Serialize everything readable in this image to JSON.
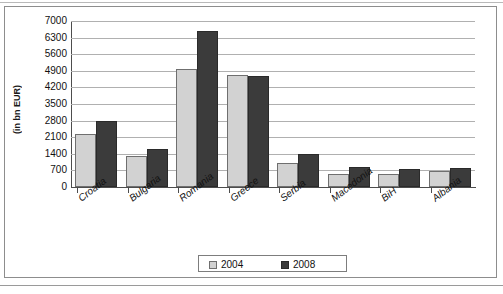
{
  "chart_data": {
    "type": "bar",
    "title": "",
    "subtitle": "",
    "xlabel": "",
    "ylabel": "(in bn EUR)",
    "ylim": [
      0,
      7000
    ],
    "ytick_step": 700,
    "yticks": [
      7000,
      6300,
      5600,
      4900,
      4200,
      3500,
      2800,
      2100,
      1400,
      700,
      0
    ],
    "grid": true,
    "legend_position": "bottom-center",
    "categories": [
      "Croatia",
      "Bulgaria",
      "Romania",
      "Greece",
      "Serbia",
      "Macedonia",
      "BiH",
      "Albania"
    ],
    "series": [
      {
        "name": "2004",
        "color": "#d2d2d2",
        "values": [
          2250,
          1320,
          4980,
          4740,
          1010,
          560,
          550,
          660
        ]
      },
      {
        "name": "2008",
        "color": "#3b3b3b",
        "values": [
          2800,
          1600,
          6600,
          4680,
          1400,
          840,
          780,
          820
        ]
      }
    ]
  },
  "legend": {
    "items": [
      {
        "label": "2004",
        "swatch": "legend-swatch-2004"
      },
      {
        "label": "2008",
        "swatch": "legend-swatch-2008"
      }
    ]
  },
  "colors": {
    "series_2004": "#d2d2d2",
    "series_2008": "#3b3b3b",
    "axis": "#4d4d4d",
    "gridline": "#b0b0b0",
    "frame_border": "#8d8d8d",
    "text": "#111111"
  }
}
